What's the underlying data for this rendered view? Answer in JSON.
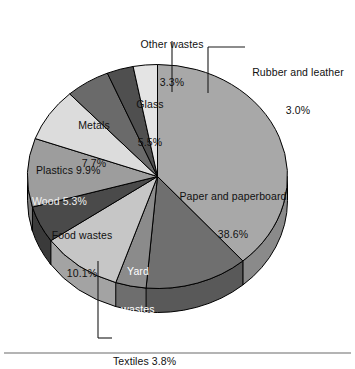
{
  "chart_data": {
    "type": "pie",
    "title": "",
    "subtitle": "",
    "xlabel": "",
    "ylabel": "",
    "legend_position": "none",
    "grid": false,
    "units": "percent",
    "total": 100.0,
    "start_angle_deg": 0,
    "direction": "clockwise",
    "three_d": true,
    "categories": [
      "Paper and paperboard",
      "Yard wastes",
      "Textiles",
      "Food wastes",
      "Wood",
      "Plastics",
      "Metals",
      "Glass",
      "Other wastes",
      "Rubber and leather"
    ],
    "values": [
      38.6,
      12.8,
      3.8,
      10.1,
      5.3,
      9.9,
      7.7,
      5.5,
      3.3,
      3.0
    ],
    "slices": [
      {
        "label": "Paper and paperboard",
        "value": 38.6,
        "value_text": "38.6%",
        "color": "#a8a8a8",
        "wall_color": "#8a8a8a",
        "label_placement": "inside",
        "label_line1": "Paper and paperboard",
        "label_line2": "38.6%"
      },
      {
        "label": "Yard wastes",
        "value": 12.8,
        "value_text": "12.8%",
        "color": "#6f6f6f",
        "wall_color": "#595959",
        "label_placement": "inside",
        "label_line1": "Yard",
        "label_line2": "wastes",
        "label_line3": "12.8%"
      },
      {
        "label": "Textiles",
        "value": 3.8,
        "value_text": "3.8%",
        "color": "#8b8b8b",
        "wall_color": "#6e6e6e",
        "label_placement": "leader",
        "label_line1": "Textiles 3.8%"
      },
      {
        "label": "Food wastes",
        "value": 10.1,
        "value_text": "10.1%",
        "color": "#c6c6c6",
        "wall_color": "#a3a3a3",
        "label_placement": "inside",
        "label_line1": "Food wastes",
        "label_line2": "10.1%"
      },
      {
        "label": "Wood",
        "value": 5.3,
        "value_text": "5.3%",
        "color": "#4a4a4a",
        "wall_color": "#3a3a3a",
        "label_placement": "inside",
        "label_line1": "Wood 5.3%"
      },
      {
        "label": "Plastics",
        "value": 9.9,
        "value_text": "9.9%",
        "color": "#9d9d9d",
        "wall_color": "#808080",
        "label_placement": "inside",
        "label_line1": "Plastics 9.9%"
      },
      {
        "label": "Metals",
        "value": 7.7,
        "value_text": "7.7%",
        "color": "#dcdcdc",
        "wall_color": "#b6b6b6",
        "label_placement": "inside",
        "label_line1": "Metals",
        "label_line2": "7.7%"
      },
      {
        "label": "Glass",
        "value": 5.5,
        "value_text": "5.5%",
        "color": "#6a6a6a",
        "wall_color": "#545454",
        "label_placement": "inside",
        "label_line1": "Glass",
        "label_line2": "5.5%"
      },
      {
        "label": "Other wastes",
        "value": 3.3,
        "value_text": "3.3%",
        "color": "#4f4f4f",
        "wall_color": "#404040",
        "label_placement": "leader",
        "label_line1": "Other wastes",
        "label_line2": "3.3%"
      },
      {
        "label": "Rubber and leather",
        "value": 3.0,
        "value_text": "3.0%",
        "color": "#e4e4e4",
        "wall_color": "#bdbdbd",
        "label_placement": "leader",
        "label_line1": "Rubber and leather",
        "label_line2": "3.0%"
      }
    ]
  },
  "labels": {
    "other_wastes_name": "Other wastes",
    "other_wastes_value": "3.3%",
    "rubber_name": "Rubber and leather",
    "rubber_value": "3.0%",
    "glass_name": "Glass",
    "glass_value": "5.5%",
    "metals_name": "Metals",
    "metals_value": "7.7%",
    "plastics": "Plastics 9.9%",
    "wood": "Wood 5.3%",
    "food_name": "Food wastes",
    "food_value": "10.1%",
    "yard_line1": "Yard",
    "yard_line2": "wastes",
    "yard_value": "12.8%",
    "paper_name": "Paper and paperboard",
    "paper_value": "38.6%",
    "textiles": "Textiles 3.8%"
  },
  "colors": {
    "background": "#ffffff",
    "text": "#111111",
    "outline": "#000000",
    "baseline_rule": "#6b6b6b"
  }
}
